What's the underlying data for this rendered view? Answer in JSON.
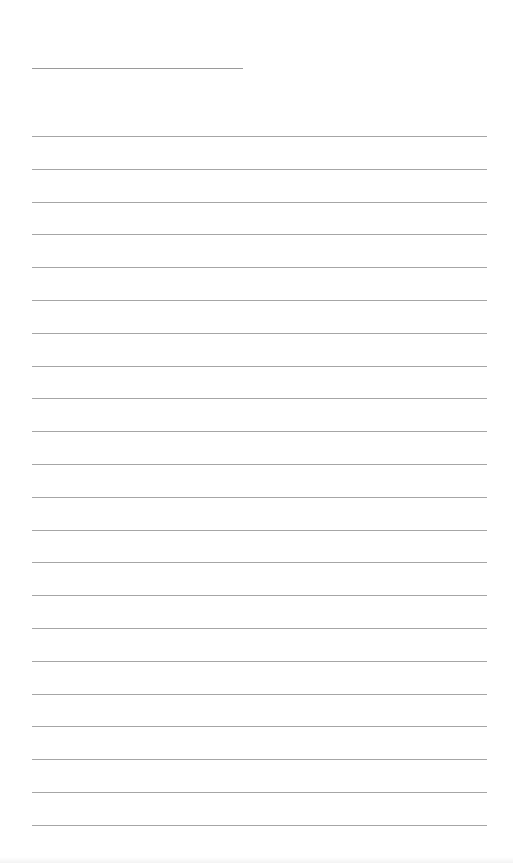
{
  "page": {
    "type": "blank-lined-notepad",
    "title_line": {
      "x": 32,
      "y": 68,
      "width": 211,
      "text": ""
    },
    "rules": {
      "count": 22,
      "start_y": 136,
      "spacing": 32.8,
      "x": 32,
      "width": 455,
      "color": "#a6a6a6"
    },
    "lines_text": [
      "",
      "",
      "",
      "",
      "",
      "",
      "",
      "",
      "",
      "",
      "",
      "",
      "",
      "",
      "",
      "",
      "",
      "",
      "",
      "",
      "",
      ""
    ]
  }
}
